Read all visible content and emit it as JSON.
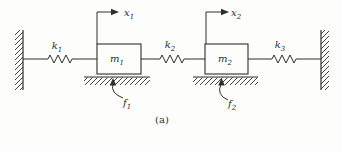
{
  "figure": {
    "caption": "(a)",
    "colors": {
      "line": "#2e2e2e",
      "background": "#fdfdfc"
    },
    "labels": {
      "k1": {
        "base": "k",
        "sub": "1"
      },
      "k2": {
        "base": "k",
        "sub": "2"
      },
      "k3": {
        "base": "k",
        "sub": "3"
      },
      "m1": {
        "base": "m",
        "sub": "1"
      },
      "m2": {
        "base": "m",
        "sub": "2"
      },
      "x1": {
        "base": "x",
        "sub": "1"
      },
      "x2": {
        "base": "x",
        "sub": "2"
      },
      "f1": {
        "base": "f",
        "sub": "1"
      },
      "f2": {
        "base": "f",
        "sub": "2"
      }
    }
  }
}
